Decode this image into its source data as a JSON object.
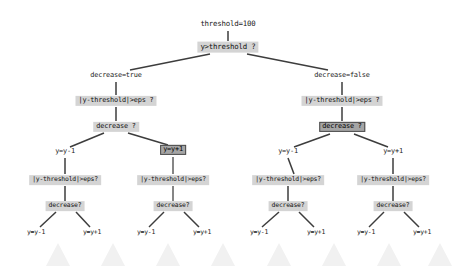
{
  "diagram": {
    "type": "decision-tree",
    "background_color": "#ffffff",
    "node_shaded_color": "#d4d4d4",
    "node_selected_color": "#a5a5a5",
    "edge_color": "#3a3a3a",
    "edge_highlight_color": "#7a7a7a",
    "watermark_color": "#f2f2f2"
  },
  "nodes": {
    "root_param": {
      "label": "threshold=100",
      "style": "plain",
      "x": 228,
      "y": 24,
      "size": "sz-10"
    },
    "root_test": {
      "label": "y>threshold ?",
      "style": "shaded",
      "x": 228,
      "y": 47,
      "size": "sz-10"
    },
    "l1_left": {
      "label": "decrease=true",
      "style": "plain",
      "x": 116,
      "y": 76,
      "size": "sz-9"
    },
    "l1_right": {
      "label": "decrease=false",
      "style": "plain",
      "x": 342,
      "y": 76,
      "size": "sz-9"
    },
    "l2_left": {
      "label": "|y-threshold|>eps ?",
      "style": "shaded",
      "x": 116,
      "y": 101,
      "size": "sz-9"
    },
    "l2_right": {
      "label": "|y-threshold|>eps ?",
      "style": "shaded",
      "x": 342,
      "y": 101,
      "size": "sz-9"
    },
    "l3_left": {
      "label": "decrease ?",
      "style": "shaded",
      "x": 116,
      "y": 127,
      "size": "sz-9"
    },
    "l3_right": {
      "label": "decrease ?",
      "style": "selected",
      "x": 342,
      "y": 127,
      "size": "sz-9"
    },
    "l4_a": {
      "label": "y=y-1",
      "style": "plain",
      "x": 65,
      "y": 152,
      "size": "sz-9"
    },
    "l4_b": {
      "label": "y=y+1",
      "style": "selected",
      "x": 173,
      "y": 150,
      "size": "sz-9"
    },
    "l4_c": {
      "label": "y=y-1",
      "style": "plain",
      "x": 288,
      "y": 152,
      "size": "sz-9"
    },
    "l4_d": {
      "label": "y=y+1",
      "style": "plain",
      "x": 393,
      "y": 152,
      "size": "sz-9"
    },
    "l5_a": {
      "label": "|y-threshold|>eps?",
      "style": "shaded",
      "x": 65,
      "y": 180,
      "size": "sz-8"
    },
    "l5_b": {
      "label": "|y-threshold|>eps?",
      "style": "shaded",
      "x": 173,
      "y": 180,
      "size": "sz-8"
    },
    "l5_c": {
      "label": "|y-threshold|>eps?",
      "style": "shaded",
      "x": 288,
      "y": 180,
      "size": "sz-8"
    },
    "l5_d": {
      "label": "|y-threshold|>eps?",
      "style": "shaded",
      "x": 393,
      "y": 180,
      "size": "sz-8"
    },
    "l6_a": {
      "label": "decrease?",
      "style": "shaded",
      "x": 65,
      "y": 206,
      "size": "sz-8"
    },
    "l6_b": {
      "label": "decrease?",
      "style": "shaded",
      "x": 173,
      "y": 206,
      "size": "sz-8"
    },
    "l6_c": {
      "label": "decrease?",
      "style": "shaded",
      "x": 288,
      "y": 206,
      "size": "sz-8"
    },
    "l6_d": {
      "label": "decrease?",
      "style": "shaded",
      "x": 393,
      "y": 206,
      "size": "sz-8"
    },
    "leaf_1": {
      "label": "y=y-1",
      "style": "plain",
      "x": 36,
      "y": 233,
      "size": "sz-8"
    },
    "leaf_2": {
      "label": "y=y+1",
      "style": "plain",
      "x": 92,
      "y": 233,
      "size": "sz-8"
    },
    "leaf_3": {
      "label": "y=y-1",
      "style": "plain",
      "x": 146,
      "y": 233,
      "size": "sz-8"
    },
    "leaf_4": {
      "label": "y=y+1",
      "style": "plain",
      "x": 202,
      "y": 233,
      "size": "sz-8"
    },
    "leaf_5": {
      "label": "y=y-1",
      "style": "plain",
      "x": 259,
      "y": 233,
      "size": "sz-8"
    },
    "leaf_6": {
      "label": "y=y+1",
      "style": "plain",
      "x": 316,
      "y": 233,
      "size": "sz-8"
    },
    "leaf_7": {
      "label": "y=y-1",
      "style": "plain",
      "x": 366,
      "y": 233,
      "size": "sz-8"
    },
    "leaf_8": {
      "label": "y=y+1",
      "style": "plain",
      "x": 422,
      "y": 233,
      "size": "sz-8"
    }
  }
}
